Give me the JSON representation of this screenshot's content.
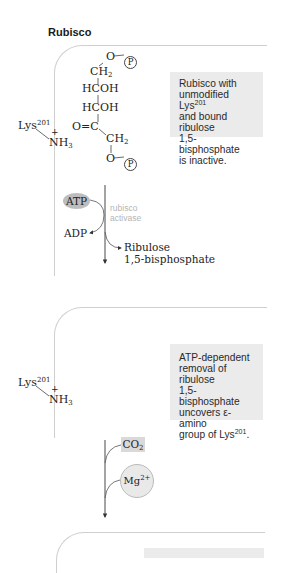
{
  "title": "Rubisco",
  "panel1": {
    "caption": {
      "line1": "Rubisco with",
      "line2_pre": "unmodified Lys",
      "line2_sup": "201",
      "line3": "and bound ribulose",
      "line4": "1,5-bisphosphate",
      "line5": "is inactive."
    },
    "lysine": {
      "label": "Lys",
      "sup": "201",
      "charge": "+",
      "group": "NH",
      "group_sub": "3"
    },
    "molecule": {
      "top_o": "O",
      "phosphate_top": "P",
      "ch2_top": "CH",
      "ch2_top_sub": "2",
      "hcoh1": "HCOH",
      "hcoh2": "HCOH",
      "carbonyl": "O=C",
      "ch2_bottom": "CH",
      "ch2_bottom_sub": "2",
      "bottom_o": "O",
      "phosphate_bottom": "P"
    },
    "reaction": {
      "atp": "ATP",
      "adp": "ADP",
      "enzyme_line1": "rubisco",
      "enzyme_line2": "activase",
      "product_line1": "Ribulose",
      "product_line2": "1,5-bisphosphate"
    }
  },
  "panel2": {
    "caption": {
      "line1": "ATP-dependent",
      "line2": "removal of ribulose",
      "line3": "1,5-bisphosphate",
      "line4": "uncovers ε-amino",
      "line5_pre": "group of Lys",
      "line5_sup": "201",
      "line5_post": "."
    },
    "lysine": {
      "label": "Lys",
      "sup": "201",
      "charge": "+",
      "group": "NH",
      "group_sub": "3"
    },
    "reaction": {
      "co2": "CO",
      "co2_sub": "2",
      "mg": "Mg",
      "mg_sup": "2+"
    }
  },
  "colors": {
    "caption_bg": "#ebebeb",
    "panel_border": "#cfcfcf",
    "atp_oval": "#bdbdbd",
    "enzyme_text": "#b5b5b5",
    "co2_box": "#d9d9d9",
    "mg_circle": "#e9e9e9"
  }
}
